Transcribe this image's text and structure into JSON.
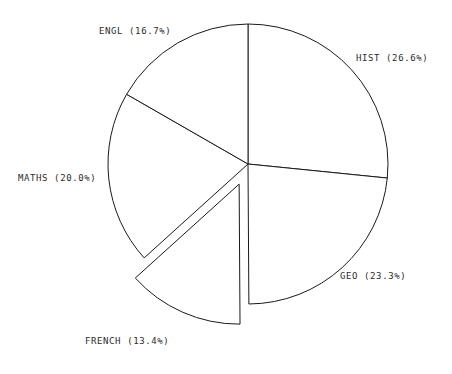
{
  "chart_data": {
    "type": "pie",
    "title": "",
    "subtitle": "",
    "xlabel": "",
    "ylabel": "",
    "legend_position": "none",
    "grid": false,
    "labels_format": "NAME (P%)",
    "total_percent": 100.0,
    "start_angle_deg": 90,
    "direction": "clockwise",
    "center": {
      "x": 248,
      "y": 164
    },
    "radius": 140,
    "categories": [
      "HIST",
      "GEO",
      "FRENCH",
      "MATHS",
      "ENGL"
    ],
    "values": [
      26.6,
      23.3,
      13.4,
      20.0,
      16.7
    ],
    "slices": [
      {
        "name": "HIST",
        "value": 26.6,
        "percent_text": "26.6%",
        "label": "HIST (26.6%)",
        "hatch": "back-diagonal",
        "exploded": false,
        "explode_offset": 0,
        "fill": "#ffffff",
        "stroke": "#1a1a1a"
      },
      {
        "name": "GEO",
        "value": 23.3,
        "percent_text": "23.3%",
        "label": "GEO (23.3%)",
        "hatch": "forward-diagonal",
        "exploded": false,
        "explode_offset": 0,
        "fill": "#ffffff",
        "stroke": "#1a1a1a"
      },
      {
        "name": "FRENCH",
        "value": 13.4,
        "percent_text": "13.4%",
        "label": "FRENCH (13.4%)",
        "hatch": "steep-diagonal",
        "exploded": true,
        "explode_offset": 22,
        "fill": "#ffffff",
        "stroke": "#1a1a1a"
      },
      {
        "name": "MATHS",
        "value": 20.0,
        "percent_text": "20.0%",
        "label": "MATHS (20.0%)",
        "hatch": "horizontal",
        "exploded": false,
        "explode_offset": 0,
        "fill": "#ffffff",
        "stroke": "#1a1a1a"
      },
      {
        "name": "ENGL",
        "value": 16.7,
        "percent_text": "16.7%",
        "label": "ENGL (16.7%)",
        "hatch": "steep-back-diagonal",
        "exploded": false,
        "explode_offset": 0,
        "fill": "#ffffff",
        "stroke": "#1a1a1a"
      }
    ],
    "background": "#ffffff",
    "line_color": "#1a1a1a"
  }
}
